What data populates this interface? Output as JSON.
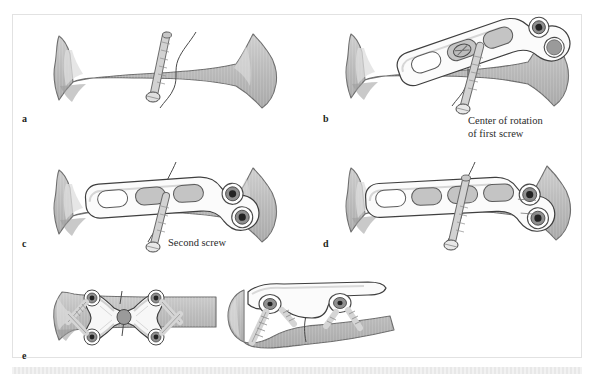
{
  "figure": {
    "background": "#ffffff",
    "border_color": "#e2e2e2"
  },
  "palette": {
    "bone_fill": "#b9b9b9",
    "bone_fill_light": "#c9c9c9",
    "bone_edge": "#6e6e6e",
    "bone_highlight": "#dcdcdc",
    "cortex_shadow": "#9d9d9d",
    "plate_fill": "#fbfbfb",
    "plate_edge": "#4a4a4a",
    "plate_shadow": "#d6d6d6",
    "hole_fill": "#bdbdbd",
    "screwhead_dark": "#2b2b2b",
    "screwhead_ring": "#8f8f8f",
    "screw_shaft": "#cccccc",
    "fracture_line": "#4a4a4a",
    "label_color": "#231f20"
  },
  "panels": [
    {
      "id": "a",
      "label": "a",
      "caption": "",
      "description": "Bone with oblique fracture fixed by a single lag screw",
      "elements": [
        "bone",
        "fracture-line",
        "lag-screw"
      ]
    },
    {
      "id": "b",
      "label": "b",
      "caption": "Center of rotation\nof first screw",
      "description": "Plate applied obliquely, first screw placed in round hole",
      "elements": [
        "bone",
        "fracture-line",
        "lag-screw",
        "plate-oblique",
        "first-screw",
        "empty-hole"
      ]
    },
    {
      "id": "c",
      "label": "c",
      "caption": "Second screw",
      "description": "Plate rotated about first screw, second screw inserted",
      "elements": [
        "bone",
        "fracture-line",
        "lag-screw",
        "plate-rotated",
        "first-screw",
        "second-screw"
      ]
    },
    {
      "id": "d",
      "label": "d",
      "caption": "",
      "description": "Plate seated along bone axis with both head screws fixed",
      "elements": [
        "bone",
        "fracture-line",
        "lag-screw",
        "plate-aligned",
        "first-screw",
        "second-screw"
      ]
    },
    {
      "id": "e",
      "label": "e",
      "caption": "",
      "description": "X-shaped plate fixation: frontal view and lateral view",
      "elements": [
        "bone",
        "x-plate",
        "corner-screws",
        "central-hole",
        "lateral-view-plate"
      ]
    }
  ],
  "annotations": [
    {
      "name": "center-of-rotation-label",
      "text": "Center of rotation\nof first screw",
      "panel": "b"
    },
    {
      "name": "second-screw-label",
      "text": "Second screw",
      "panel": "c"
    }
  ],
  "plate_spec": {
    "slot_count": 4,
    "round_hole_count": 2,
    "head_shape": "bilobed",
    "shaft_shape": "straight-slotted"
  },
  "x_plate_spec": {
    "screw_count": 4,
    "central_hole": true,
    "shape": "butterfly-x"
  }
}
